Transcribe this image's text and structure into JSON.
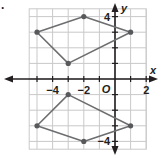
{
  "diagram": {
    "type": "coordinate-plane",
    "axes": {
      "x_label": "x",
      "y_label": "y",
      "origin_label": "O",
      "x_tick_labels": [
        {
          "value": -4,
          "text": "−4"
        },
        {
          "value": -2,
          "text": "−2"
        },
        {
          "value": 2,
          "text": "2"
        }
      ],
      "y_tick_labels": [
        {
          "value": 4,
          "text": "4"
        },
        {
          "value": -4,
          "text": "−4"
        }
      ],
      "x_range": [
        -5.5,
        2.5
      ],
      "y_range": [
        -4.5,
        4.5
      ]
    },
    "grid": true,
    "figures": [
      {
        "name": "upper-quadrilateral",
        "vertices": [
          [
            -5,
            3
          ],
          [
            -2,
            4
          ],
          [
            1,
            3
          ],
          [
            -3,
            1
          ]
        ]
      },
      {
        "name": "lower-quadrilateral",
        "vertices": [
          [
            -3,
            -1
          ],
          [
            1,
            -3
          ],
          [
            -2,
            -4
          ],
          [
            -5,
            -3
          ]
        ]
      }
    ],
    "colors": {
      "grid": "#c9c9c9",
      "axes": "#231f20",
      "polygon": "#6d6e70",
      "vertex": "#58595b"
    },
    "corner_mark": "."
  }
}
